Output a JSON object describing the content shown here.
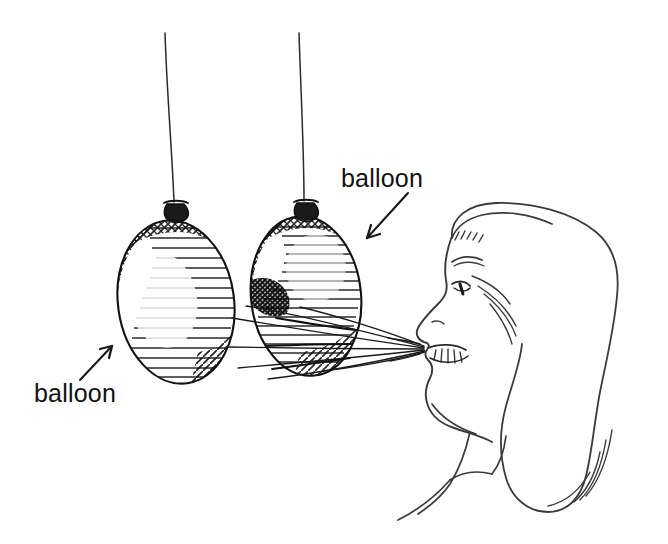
{
  "illustration": {
    "title": "balloons-blown-apart-by-breath",
    "medium": "pen-and-ink line drawing",
    "background_color": "#ffffff",
    "ink_color": "#111111"
  },
  "labels": [
    {
      "id": "label-left",
      "text": "balloon",
      "x": 34,
      "y": 402,
      "arrow": {
        "from_x": 80,
        "from_y": 380,
        "to_x": 113,
        "to_y": 345,
        "points_to": "left-balloon"
      }
    },
    {
      "id": "label-right",
      "text": "balloon",
      "x": 341,
      "y": 187,
      "arrow": {
        "from_x": 407,
        "from_y": 194,
        "to_x": 366,
        "to_y": 239,
        "points_to": "right-balloon"
      }
    }
  ],
  "objects": {
    "left_balloon": {
      "name": "left-balloon",
      "center_x": 176,
      "center_y": 302,
      "radius_x": 58,
      "radius_y": 82,
      "rotation": -8,
      "knot_x": 175,
      "knot_y": 207,
      "string_top_y": 32
    },
    "right_balloon": {
      "name": "right-balloon",
      "center_x": 306,
      "center_y": 296,
      "radius_x": 55,
      "radius_y": 80,
      "rotation": -6,
      "knot_x": 305,
      "knot_y": 206,
      "string_top_y": 32
    },
    "person": {
      "name": "woman-profile-blowing",
      "facing": "left",
      "head_top_y": 205,
      "mouth_x": 425,
      "mouth_y": 348,
      "hair_right_x": 617,
      "shoulder_y": 500
    },
    "air_stream": {
      "name": "breath-air-stream",
      "origin_x": 424,
      "origin_y": 349,
      "line_count": 6,
      "spread_left_x": 120
    }
  }
}
